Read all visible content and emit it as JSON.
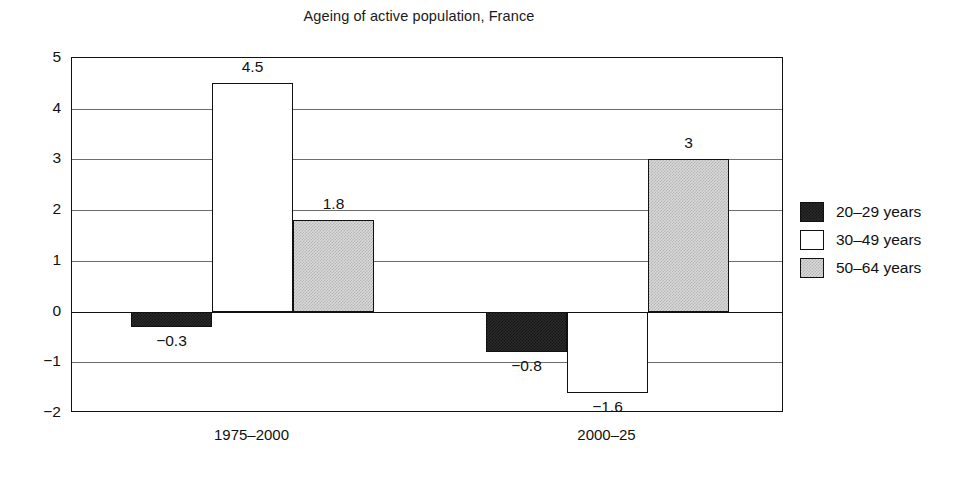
{
  "chart_data": {
    "type": "bar",
    "title": "Ageing of active population, France",
    "xlabel": "",
    "ylabel": "",
    "ylim": [
      -2,
      5
    ],
    "yticks": [
      5,
      4,
      3,
      2,
      1,
      0,
      -1,
      -2
    ],
    "ytick_labels": [
      "5",
      "4",
      "3",
      "2",
      "1",
      "0",
      "−1",
      "−2"
    ],
    "grid": true,
    "legend_position": "right",
    "categories": [
      "1975–2000",
      "2000–25"
    ],
    "series": [
      {
        "name": "20–29 years",
        "style": "dark",
        "color": "#2a2a2a",
        "values": [
          -0.3,
          -0.8
        ],
        "value_labels": [
          "−0.3",
          "−0.8"
        ]
      },
      {
        "name": "30–49 years",
        "style": "white",
        "color": "#ffffff",
        "values": [
          4.5,
          -1.6
        ],
        "value_labels": [
          "4.5",
          "−1.6"
        ]
      },
      {
        "name": "50–64 years",
        "style": "gray",
        "color": "#d9d9d9",
        "values": [
          1.8,
          3
        ],
        "value_labels": [
          "1.8",
          "3"
        ]
      }
    ]
  },
  "legend": {
    "items": [
      {
        "label": "20–29 years",
        "style": "dark"
      },
      {
        "label": "30–49 years",
        "style": "white"
      },
      {
        "label": "50–64 years",
        "style": "gray"
      }
    ]
  }
}
